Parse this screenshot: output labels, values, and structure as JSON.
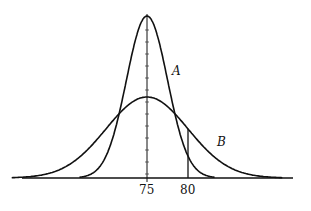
{
  "chart_data": {
    "type": "line",
    "title": "",
    "xlabel": "",
    "ylabel": "",
    "series": [
      {
        "name": "A",
        "mean": 75,
        "sigma": 2.5,
        "peak_rel": 2.0
      },
      {
        "name": "B",
        "mean": 75,
        "sigma": 5,
        "peak_rel": 1.0
      }
    ],
    "x_ticks": [
      "75",
      "80"
    ],
    "annotations": [
      {
        "type": "vertical-line",
        "x": 80
      },
      {
        "type": "vertical-axis",
        "x": 75
      }
    ]
  },
  "labels": {
    "curve_a": "A",
    "curve_b": "B",
    "tick_75": "75",
    "tick_80": "80"
  }
}
